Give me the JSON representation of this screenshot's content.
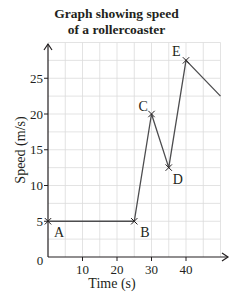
{
  "chart_data": {
    "type": "line",
    "title": "Graph showing speed of a rollercoaster",
    "title_lines": [
      "Graph showing speed",
      "of a rollercoaster"
    ],
    "xlabel": "Time (s)",
    "ylabel": "Speed (m/s)",
    "xlim": [
      0,
      50
    ],
    "ylim": [
      0,
      30
    ],
    "grid": true,
    "x_ticks": [
      0,
      10,
      20,
      30,
      40
    ],
    "x_tick_labels": [
      "10",
      "20",
      "30",
      "40"
    ],
    "y_ticks": [
      5,
      10,
      15,
      20,
      25
    ],
    "y_tick_labels": [
      "5",
      "10",
      "15",
      "20",
      "25"
    ],
    "origin_label": "0",
    "series": [
      {
        "name": "Speed",
        "x": [
          0,
          25,
          30,
          35,
          40,
          50
        ],
        "y": [
          5,
          5,
          20,
          12.5,
          27.5,
          22.5
        ],
        "color": "#4d4d4f"
      }
    ],
    "points": [
      {
        "label": "A",
        "x": 0,
        "y": 5
      },
      {
        "label": "B",
        "x": 25,
        "y": 5
      },
      {
        "label": "C",
        "x": 30,
        "y": 20
      },
      {
        "label": "D",
        "x": 35,
        "y": 12.5
      },
      {
        "label": "E",
        "x": 40,
        "y": 27.5
      }
    ]
  }
}
